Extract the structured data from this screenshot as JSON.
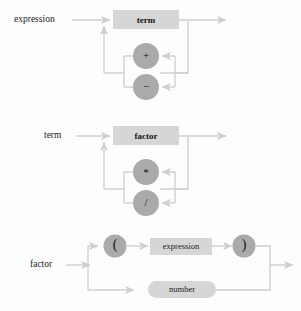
{
  "figure": {
    "kind": "railroad-syntax-diagram",
    "background_color": "#fdfdfd",
    "box_fill": "#d6d6d6",
    "circle_fill": "#aaaaaa",
    "line_color": "#cfcfcf",
    "text_color": "#1a1a1a"
  },
  "diagrams": [
    {
      "id": "expression",
      "entry_label": "expression",
      "main_node": "term",
      "main_node_shape": "rect",
      "loop_nodes": [
        {
          "label": "+",
          "shape": "circle"
        },
        {
          "label": "−",
          "shape": "circle"
        }
      ]
    },
    {
      "id": "term",
      "entry_label": "term",
      "main_node": "factor",
      "main_node_shape": "rect",
      "loop_nodes": [
        {
          "label": "*",
          "shape": "circle"
        },
        {
          "label": "/",
          "shape": "circle"
        }
      ]
    },
    {
      "id": "factor",
      "entry_label": "factor",
      "branches": [
        {
          "id": "paren-branch",
          "nodes": [
            {
              "label": "(",
              "shape": "circle"
            },
            {
              "label": "expression",
              "shape": "rect"
            },
            {
              "label": ")",
              "shape": "circle"
            }
          ]
        },
        {
          "id": "number-branch",
          "nodes": [
            {
              "label": "number",
              "shape": "pill"
            }
          ]
        }
      ]
    }
  ]
}
